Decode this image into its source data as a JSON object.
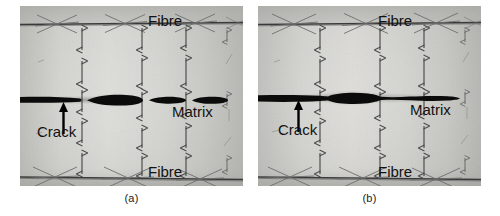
{
  "figure": {
    "type": "micrograph-pair",
    "panels": [
      {
        "id": "a",
        "caption": "(a)",
        "labels": {
          "fibre_top": "Fibre",
          "fibre_bottom": "Fibre",
          "matrix": "Matrix",
          "crack": "Crack"
        },
        "crack": {
          "description": "discontinuous segmented crack",
          "segments": [
            {
              "x1": 0,
              "x2": 62,
              "max_half_thickness": 3.0
            },
            {
              "x1": 68,
              "x2": 122,
              "max_half_thickness": 5.5
            },
            {
              "x1": 128,
              "x2": 166,
              "max_half_thickness": 3.6
            },
            {
              "x1": 172,
              "x2": 208,
              "max_half_thickness": 3.8
            }
          ],
          "y_center": 94
        },
        "arrow_columns": [
          62,
          122,
          166,
          207
        ],
        "fibre_line_y": {
          "top": 18,
          "bottom": 172
        }
      },
      {
        "id": "b",
        "caption": "(b)",
        "labels": {
          "fibre_top": "Fibre",
          "fibre_bottom": "Fibre",
          "matrix": "Matrix",
          "crack": "Crack"
        },
        "crack": {
          "description": "coalesced continuous crack",
          "segments": [
            {
              "x1": 0,
              "x2": 200,
              "max_half_thickness": 5.5
            }
          ],
          "y_center": 92
        },
        "arrow_columns": [
          62,
          122,
          166,
          207
        ],
        "fibre_line_y": {
          "top": 18,
          "bottom": 172
        }
      }
    ],
    "colors": {
      "matrix_light": "#d5d5d1",
      "matrix_mid": "#c4c4c0",
      "matrix_dark": "#b4b4b0",
      "fibre_line": "#3c3c3c",
      "crack": "#0b0b0b",
      "arrow_stroke": "#4a4a4a",
      "crack_arrow": "#000000",
      "text": "#121212",
      "background": "#ffffff"
    }
  }
}
